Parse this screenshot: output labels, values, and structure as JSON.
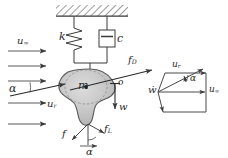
{
  "figure": {
    "width": 228,
    "height": 158,
    "background": "#ffffff",
    "stroke_color": "#3a3a3a",
    "blob_fill": "#c9c9c9",
    "blob_stroke": "#555555"
  },
  "support": {
    "name": "fixed-ceiling-hatching",
    "hatch_label": ""
  },
  "elements": {
    "spring_label": "k",
    "damper_label": "c",
    "mass_label": "m",
    "vertical_disp_label": "w",
    "origin_label": "o"
  },
  "wind": {
    "freestream_label": "u",
    "freestream_sub": "∞",
    "relative_label": "u",
    "relative_sub": "r",
    "angle_label": "α",
    "arrow_count": 5
  },
  "forces": {
    "drag_label": "f",
    "drag_sub": "D",
    "lift_label": "f",
    "lift_sub": "L",
    "resultant_label": "f",
    "angle_label": "α"
  },
  "velocity_triangle": {
    "name": "velocity-vector-parallelogram",
    "relative_label": "u",
    "relative_sub": "r",
    "freestream_label": "u",
    "freestream_sub": "∞",
    "vertical_label": "ẇ",
    "angle_label": "α"
  }
}
